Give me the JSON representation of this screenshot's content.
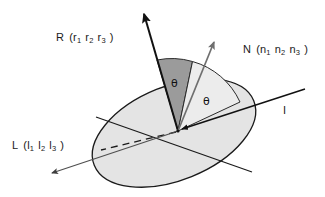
{
  "figure": {
    "kind": "reflection-geometry-diagram",
    "width": 325,
    "height": 197,
    "background_color": "#ffffff"
  },
  "labels": {
    "reflection": {
      "symbol": "R",
      "open_paren": "(",
      "close_paren": ")",
      "components": [
        {
          "base": "r",
          "sub": "1"
        },
        {
          "base": "r",
          "sub": "2"
        },
        {
          "base": "r",
          "sub": "3"
        }
      ],
      "full_text": "R (r1 r2 r3)"
    },
    "normal": {
      "symbol": "N",
      "open_paren": "(",
      "close_paren": ")",
      "components": [
        {
          "base": "n",
          "sub": "1"
        },
        {
          "base": "n",
          "sub": "2"
        },
        {
          "base": "n",
          "sub": "3"
        }
      ],
      "full_text": "N (n1 n2 n3)"
    },
    "light": {
      "symbol": "L",
      "open_paren": "(",
      "close_paren": ")",
      "components": [
        {
          "base": "l",
          "sub": "1"
        },
        {
          "base": "l",
          "sub": "2"
        },
        {
          "base": "l",
          "sub": "3"
        }
      ],
      "full_text": "L (l1 l2 l3)"
    },
    "incident": {
      "symbol": "I",
      "full_text": "I"
    },
    "angle_left": "θ",
    "angle_right": "θ"
  },
  "colors": {
    "stroke_dark": "#111111",
    "stroke_gray": "#6f6f6f",
    "surface_fill": "#e4e4e4",
    "surface_stroke": "#1a1a1a",
    "sector_dark_fill": "#9b9b9b",
    "sector_light_fill": "#ececec",
    "sector_stroke": "#2a2a2a",
    "text": "#1a1a1a"
  },
  "geometry": {
    "origin": {
      "x": 178,
      "y": 131
    },
    "surface_ellipse": {
      "cx": 174,
      "cy": 133,
      "rx": 86,
      "ry": 47,
      "rotation_deg": -22
    },
    "vectors": [
      {
        "name": "R",
        "tip": {
          "x": 143,
          "y": 8
        },
        "color": "#111111",
        "width": 2.0,
        "arrow": "filled"
      },
      {
        "name": "N",
        "tip": {
          "x": 216,
          "y": 38
        },
        "color": "#6f6f6f",
        "width": 1.6,
        "arrow": "filled"
      },
      {
        "name": "L",
        "tip": {
          "x": 47,
          "y": 175
        },
        "color": "#4f4f4f",
        "width": 1.4,
        "arrow": "filled"
      },
      {
        "name": "I",
        "tip": {
          "x": 178,
          "y": 131
        },
        "color": "#111111",
        "width": 1.6,
        "arrow": "filled"
      }
    ],
    "incident_ray_start": {
      "x": 305,
      "y": 89
    },
    "dashed_segment": {
      "x1": 178,
      "y1": 131,
      "x2": 101,
      "y2": 150
    },
    "surface_chord": {
      "x1": 96,
      "y1": 117,
      "x2": 252,
      "y2": 172
    },
    "angle_arc_outer_radius": 74
  }
}
